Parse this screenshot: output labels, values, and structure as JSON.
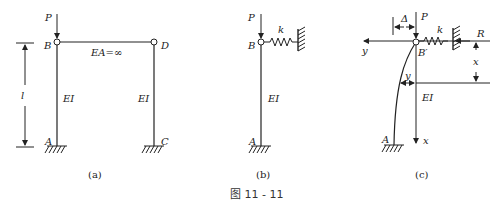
{
  "figure_title": "图 11 - 11",
  "panel_a": {
    "caption": "(a)",
    "load": "P",
    "node_top_left": "B",
    "node_top_right": "D",
    "node_bottom_left": "A",
    "node_bottom_right": "C",
    "beam_label": "EA=∞",
    "left_column_label": "EI",
    "right_column_label": "EI",
    "length_label": "l"
  },
  "panel_b": {
    "caption": "(b)",
    "load": "P",
    "node_top": "B",
    "node_bottom": "A",
    "spring_label": "k",
    "column_label": "EI"
  },
  "panel_c": {
    "caption": "(c)",
    "load": "P",
    "displacement_label": "Δ",
    "spring_label": "k",
    "reaction_label": "R",
    "node_top": "B′",
    "node_bottom": "A",
    "y_axis_label": "y",
    "x_axis_label": "x",
    "x_dim_label": "x",
    "deflection_label": "y",
    "column_label": "EI"
  }
}
